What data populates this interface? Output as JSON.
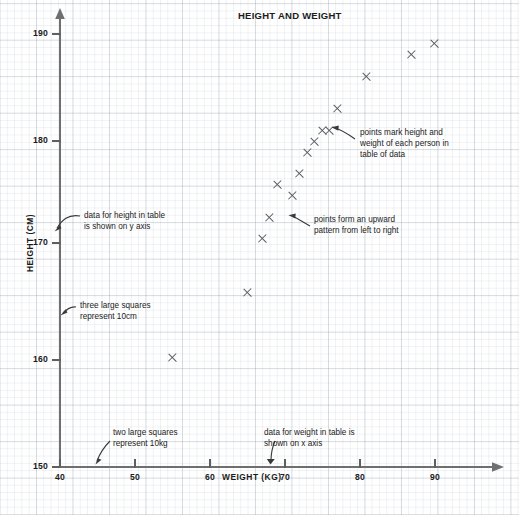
{
  "chart_data": {
    "type": "scatter",
    "title": "HEIGHT AND WEIGHT",
    "xlabel": "WEIGHT (KG)",
    "ylabel": "HEIGHT (CM)",
    "xlim": [
      40,
      96
    ],
    "ylim": [
      150,
      191
    ],
    "xticks": [
      40,
      50,
      60,
      70,
      80,
      90
    ],
    "yticks": [
      150,
      160,
      170,
      180,
      190
    ],
    "grid": true,
    "legend": "none",
    "marker": "x",
    "x": [
      55,
      65,
      67,
      68,
      69,
      71,
      72,
      73,
      74,
      75,
      76,
      77,
      81,
      87,
      90
    ],
    "y": [
      160,
      166,
      171,
      173,
      176,
      175,
      177,
      179,
      180,
      181,
      181,
      183,
      186,
      188,
      189
    ],
    "points": [
      {
        "x": 55,
        "y": 160
      },
      {
        "x": 65,
        "y": 166
      },
      {
        "x": 67,
        "y": 171
      },
      {
        "x": 68,
        "y": 173
      },
      {
        "x": 69,
        "y": 176
      },
      {
        "x": 71,
        "y": 175
      },
      {
        "x": 72,
        "y": 177
      },
      {
        "x": 73,
        "y": 179
      },
      {
        "x": 74,
        "y": 180
      },
      {
        "x": 75,
        "y": 181
      },
      {
        "x": 76,
        "y": 181
      },
      {
        "x": 77,
        "y": 183
      },
      {
        "x": 81,
        "y": 186
      },
      {
        "x": 87,
        "y": 188
      },
      {
        "x": 90,
        "y": 189
      }
    ],
    "annotations": [
      {
        "id": "y-axis-note",
        "text": "data for height in table\nis shown on y axis",
        "target": "y-axis"
      },
      {
        "id": "gridsize-height-note",
        "text": "three large squares\nrepresent 10cm",
        "target": "y-axis"
      },
      {
        "id": "gridsize-weight-note",
        "text": "two large squares\nrepresent 10kg",
        "target": "x-axis"
      },
      {
        "id": "x-axis-note",
        "text": "data for weight in table is\nshown on x axis",
        "target": "x-axis"
      },
      {
        "id": "points-meaning-note",
        "text": "points mark height and\nweight of each person in\ntable of data",
        "target": "data-point"
      },
      {
        "id": "trend-note",
        "text": "points form an upward\npattern from left to right",
        "target": "data-point"
      }
    ],
    "colors": {
      "marker": "#555a60",
      "axis": "#6f6f6f",
      "grid_minor": "#e3e8ec",
      "grid_major": "#d3dae1",
      "text": "#1b1b1b",
      "background": "#ffffff"
    }
  },
  "axis": {
    "y_tick_labels": [
      "190",
      "180",
      "170",
      "160",
      "150"
    ],
    "x_tick_labels": [
      "40",
      "50",
      "60",
      "70",
      "80",
      "90"
    ],
    "y_title": "HEIGHT (CM)",
    "x_title": "WEIGHT (KG)"
  },
  "title": "HEIGHT AND WEIGHT",
  "annotation_text": {
    "y_axis_note": "data for height in table\nis shown on y axis",
    "height_grid_note": "three large squares\nrepresent 10cm",
    "weight_grid_note": "two large squares\nrepresent 10kg",
    "x_axis_note": "data for weight in table is\nshown on x axis",
    "points_meaning_note": "points mark height and\nweight of each person in\ntable of data",
    "trend_note": "points form an upward\npattern from left to right"
  }
}
